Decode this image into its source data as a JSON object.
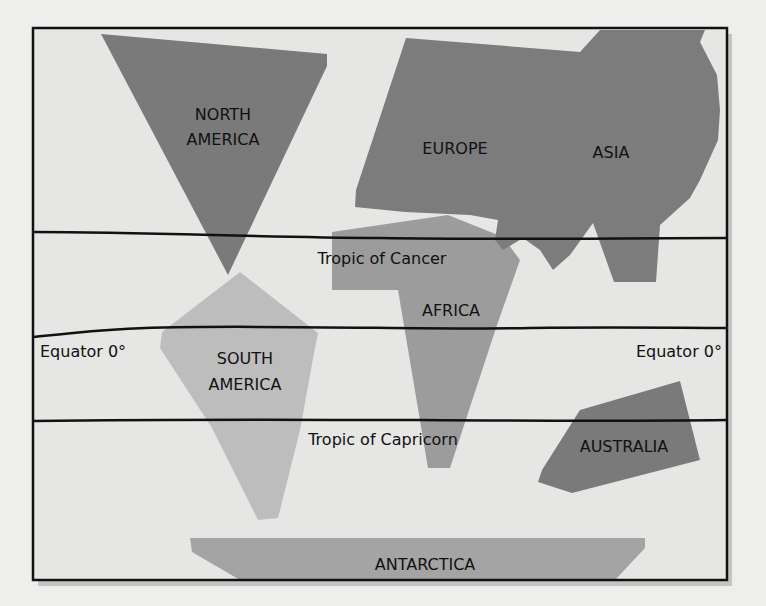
{
  "colors": {
    "background": "#e6e6e4",
    "frame": "#111111",
    "dark_land": "#7a7a7a",
    "medium_land": "#9a9a9a",
    "light_land": "#bdbdbd",
    "line": "#111111"
  },
  "continents": {
    "north_america": {
      "line1": "NORTH",
      "line2": "AMERICA"
    },
    "south_america": {
      "line1": "SOUTH",
      "line2": "AMERICA"
    },
    "europe": "EUROPE",
    "asia": "ASIA",
    "africa": "AFRICA",
    "australia": "AUSTRALIA",
    "antarctica": "ANTARCTICA"
  },
  "lines": {
    "tropic_of_cancer": "Tropic of Cancer",
    "equator_left": "Equator 0°",
    "equator_right": "Equator 0°",
    "tropic_of_capricorn": "Tropic of Capricorn"
  }
}
